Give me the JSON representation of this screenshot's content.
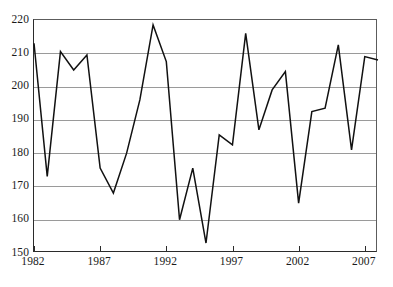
{
  "chart_data": {
    "type": "line",
    "title": "",
    "subtitle": "",
    "xlabel": "",
    "ylabel": "",
    "xlim": [
      1982,
      2008
    ],
    "ylim": [
      150,
      220
    ],
    "yticks": [
      150,
      160,
      170,
      180,
      190,
      200,
      210,
      220
    ],
    "ytick_labels": [
      "150",
      "160",
      "170",
      "180",
      "190",
      "200",
      "210",
      "220"
    ],
    "xticks": [
      1982,
      1987,
      1992,
      1997,
      2002,
      2007
    ],
    "xtick_labels": [
      "1982",
      "1987",
      "1992",
      "1997",
      "2002",
      "2007"
    ],
    "grid": "horizontal",
    "legend": "none",
    "annotations": [],
    "line_color": "#111111",
    "grid_color": "#9a9a9a",
    "axis_color": "#2b2b2b",
    "x": [
      1982,
      1983,
      1984,
      1985,
      1986,
      1987,
      1988,
      1989,
      1990,
      1991,
      1992,
      1993,
      1994,
      1995,
      1996,
      1997,
      1998,
      1999,
      2000,
      2001,
      2002,
      2003,
      2004,
      2005,
      2006,
      2007,
      2008
    ],
    "values": [
      213,
      173,
      210.5,
      205,
      209.5,
      175.5,
      168,
      180,
      196,
      218.5,
      207.5,
      160,
      175.5,
      153,
      185.5,
      182.5,
      216,
      187,
      199,
      204.5,
      165,
      192.5,
      193.5,
      212.5,
      181,
      209,
      208
    ],
    "series": [
      {
        "name": "series-1",
        "values": [
          213,
          173,
          210.5,
          205,
          209.5,
          175.5,
          168,
          180,
          196,
          218.5,
          207.5,
          160,
          175.5,
          153,
          185.5,
          182.5,
          216,
          187,
          199,
          204.5,
          165,
          192.5,
          193.5,
          212.5,
          181,
          209,
          208
        ]
      }
    ]
  }
}
